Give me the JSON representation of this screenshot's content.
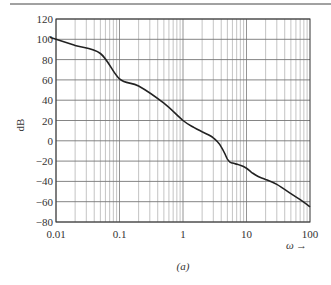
{
  "chart_data": {
    "type": "line",
    "title": "",
    "caption": "(a)",
    "xlabel": "ω",
    "xlabel_arrow": "→",
    "ylabel": "dB",
    "xscale": "log",
    "xlim": [
      0.01,
      100
    ],
    "ylim": [
      -80,
      120
    ],
    "grid": true,
    "legend": null,
    "x_ticks": [
      {
        "value": 0.01,
        "label": "0.01"
      },
      {
        "value": 0.1,
        "label": "0.1"
      },
      {
        "value": 1,
        "label": "1"
      },
      {
        "value": 10,
        "label": "10"
      },
      {
        "value": 100,
        "label": "100"
      }
    ],
    "y_ticks": [
      {
        "value": 120,
        "label": "120"
      },
      {
        "value": 100,
        "label": "100"
      },
      {
        "value": 80,
        "label": "80"
      },
      {
        "value": 60,
        "label": "60"
      },
      {
        "value": 40,
        "label": "40"
      },
      {
        "value": 20,
        "label": "20"
      },
      {
        "value": 0,
        "label": "0"
      },
      {
        "value": -20,
        "label": "−20"
      },
      {
        "value": -40,
        "label": "−40"
      },
      {
        "value": -60,
        "label": "−60"
      },
      {
        "value": -80,
        "label": "−80"
      }
    ],
    "series": [
      {
        "name": "magnitude",
        "color": "#222222",
        "x": [
          0.008,
          0.01,
          0.02,
          0.05,
          0.1,
          0.2,
          0.5,
          1,
          1.5,
          2,
          2.5,
          3,
          3.5,
          4,
          4.5,
          5,
          5.5,
          6,
          7,
          8,
          10,
          12,
          15,
          20,
          30,
          50,
          70,
          100
        ],
        "values": [
          102,
          100,
          94,
          86,
          61,
          54,
          37,
          20,
          13,
          9,
          6,
          3,
          -1,
          -6,
          -12,
          -18,
          -21,
          -22,
          -23,
          -24,
          -27,
          -31,
          -35,
          -38,
          -43,
          -52,
          -58,
          -65
        ]
      }
    ]
  },
  "figure": {
    "caption": "(a)",
    "axis_label_y": "dB",
    "axis_label_x": "ω",
    "axis_arrow": "→"
  }
}
